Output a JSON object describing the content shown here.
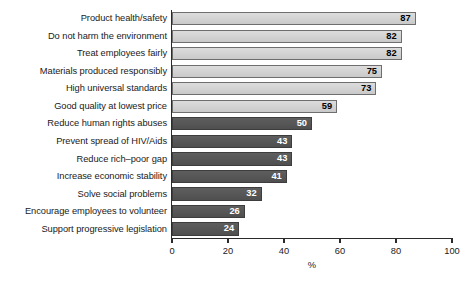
{
  "chart_data": {
    "type": "bar",
    "orientation": "horizontal",
    "title": "",
    "subtitle": "",
    "xlabel": "%",
    "ylabel": "",
    "xlim": [
      0,
      100
    ],
    "xticks": [
      0,
      20,
      40,
      60,
      80,
      100
    ],
    "xtick_labels": [
      "0",
      "20",
      "40",
      "60",
      "80",
      "100"
    ],
    "grid": false,
    "legend": "none",
    "categories": [
      "Product health/safety",
      "Do not harm the environment",
      "Treat employees fairly",
      "Materials produced responsibly",
      "High universal standards",
      "Good quality at lowest price",
      "Reduce human rights abuses",
      "Prevent spread of HIV/Aids",
      "Reduce rich–poor gap",
      "Increase economic stability",
      "Solve social problems",
      "Encourage employees to volunteer",
      "Support progressive legislation"
    ],
    "values": [
      87,
      82,
      82,
      75,
      73,
      59,
      50,
      43,
      43,
      41,
      32,
      26,
      24
    ],
    "value_labels": [
      "87",
      "82",
      "82",
      "75",
      "73",
      "59",
      "50",
      "43",
      "43",
      "41",
      "32",
      "26",
      "24"
    ],
    "bar_styles": [
      "light",
      "light",
      "light",
      "light",
      "light",
      "light",
      "dark",
      "dark",
      "dark",
      "dark",
      "dark",
      "dark",
      "dark"
    ],
    "colors": {
      "bar_light_fill": "#d4d4d4",
      "bar_light_border": "#6e6e6e",
      "bar_dark_fill": "#585858",
      "bar_dark_border": "#3d3d3d",
      "axis": "#2b2b2b",
      "text": "#1a1a1a",
      "value_text_light_bar": "#000000",
      "value_text_dark_bar": "#ffffff",
      "background": "#ffffff"
    }
  }
}
